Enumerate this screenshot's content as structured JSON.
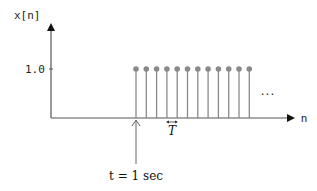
{
  "diagram": {
    "y_axis_label": "x[n]",
    "x_axis_label": "n",
    "y_tick_label": "1.0",
    "ellipsis": "···",
    "period_label": "T",
    "time_annotation": "t = 1 sec",
    "stem_color": "#8a8a8a",
    "axis_color": "#555555"
  },
  "chart_data": {
    "type": "stem",
    "title": "",
    "xlabel": "n",
    "ylabel": "x[n]",
    "yticks": [
      1.0
    ],
    "stems": {
      "count": 12,
      "amplitude": 1.0,
      "spacing": "T",
      "start": "t = 1 sec",
      "continues": true
    }
  }
}
